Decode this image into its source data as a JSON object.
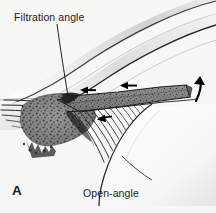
{
  "figure": {
    "panel_letter": "A",
    "caption": "Open-angle",
    "annotation_label": "Filtration angle",
    "background_color": "#f7f7f5",
    "ink_color": "#1a1a1a",
    "tissue_mid_gray": "#8a8a88",
    "tissue_dark_gray": "#4a4a48",
    "tissue_light_gray": "#d8d8d4",
    "width": 216,
    "height": 213
  },
  "structures": {
    "cornea_label": "cornea",
    "sclera_label": "sclera",
    "iris_label": "iris",
    "trabecular_meshwork_label": "trabecular-meshwork",
    "ciliary_body_label": "ciliary-body",
    "lens_label": "lens",
    "angle_recess_label": "angle-recess"
  },
  "arrows": {
    "flow_arrow_1": "aqueous-flow-left",
    "flow_arrow_2": "aqueous-flow-left",
    "flow_arrow_3": "aqueous-flow-into-meshwork",
    "curved_arrow": "aqueous-flow-curved-up"
  },
  "leader_line": {
    "name": "filtration-angle-leader-line",
    "from_x": 57,
    "from_y": 24,
    "to_x": 68,
    "to_y": 96
  }
}
